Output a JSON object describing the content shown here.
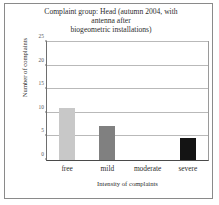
{
  "figure": {
    "title_lines": [
      "Complaint group: Head (autumn 2004, with",
      "antenna after",
      "biogeometric installations)"
    ]
  },
  "chart_data": {
    "type": "bar",
    "title": "Complaint group: Head (autumn 2004, with antenna after biogeometric installations)",
    "categories": [
      "free",
      "mild",
      "moderate",
      "severe"
    ],
    "values": [
      11,
      7.3,
      0,
      4.7
    ],
    "bar_colors": [
      "#c8c8c8",
      "#808080",
      "#ffffff",
      "#141414"
    ],
    "xlabel": "Intensity of complaints",
    "ylabel": "Number of complaints",
    "ylim": [
      0,
      25
    ],
    "yticks": [
      0,
      5,
      10,
      15,
      20,
      25
    ],
    "ytick_labels": [
      "0",
      "5",
      "10",
      "15",
      "20",
      "25"
    ],
    "grid": true,
    "legend": false
  }
}
